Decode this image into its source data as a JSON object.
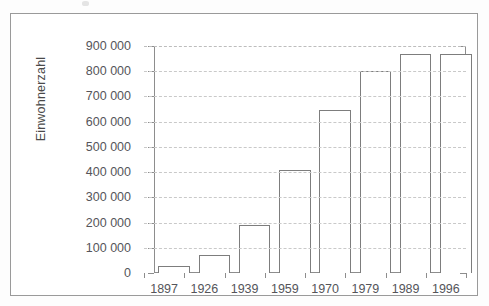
{
  "chart_data": {
    "type": "bar",
    "title": "",
    "xlabel": "",
    "ylabel": "Einwohnerzahl",
    "categories": [
      "1897",
      "1926",
      "1939",
      "1959",
      "1970",
      "1979",
      "1989",
      "1996"
    ],
    "values": [
      27000,
      72000,
      192000,
      410000,
      645000,
      800000,
      870000,
      870000
    ],
    "ylim": [
      0,
      900000
    ],
    "ytick_values": [
      0,
      100000,
      200000,
      300000,
      400000,
      500000,
      600000,
      700000,
      800000,
      900000
    ],
    "ytick_labels": [
      "0",
      "100 000",
      "200 000",
      "300 000",
      "400 000",
      "500 000",
      "600 000",
      "700 000",
      "800 000",
      "900 000"
    ],
    "grid": true,
    "grid_style": "dashed-horizontal",
    "legend": false,
    "bar_fill": "#ffffff",
    "bar_border": "#7d7d7d",
    "axis_color": "#8d8d8d",
    "gridline_color": "#c9c9c9",
    "text_color": "#55555a",
    "frame_border": "#9a9a9a"
  }
}
